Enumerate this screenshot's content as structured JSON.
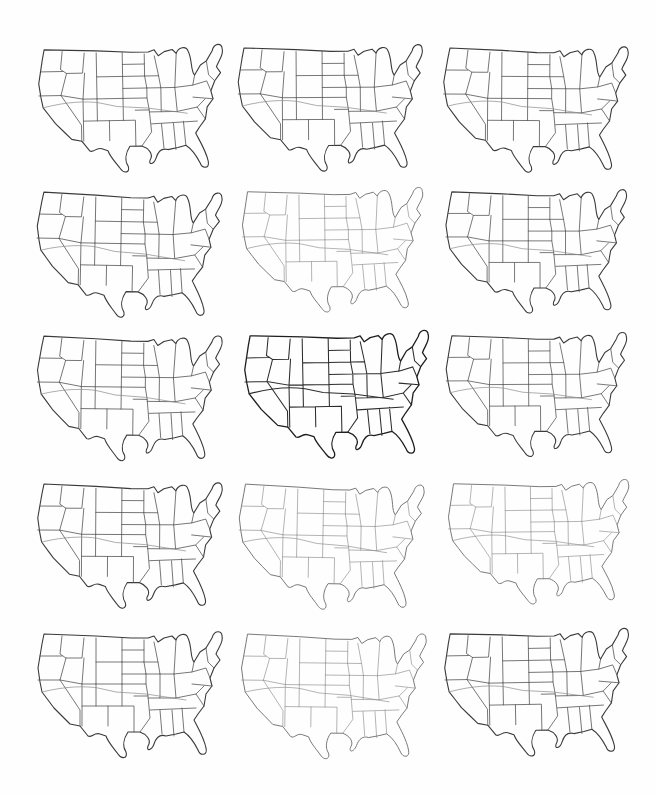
{
  "page": {
    "background": "#fefefe",
    "ink_color": "#333333"
  },
  "grid": {
    "columns": 3,
    "rows": 5,
    "maps": [
      {
        "row": 1,
        "col": 1,
        "style": "normal",
        "x": 0,
        "y": 4,
        "scale": 1.0
      },
      {
        "row": 1,
        "col": 2,
        "style": "normal",
        "x": 200,
        "y": 2,
        "scale": 1.0
      },
      {
        "row": 1,
        "col": 3,
        "style": "normal",
        "x": 406,
        "y": 2,
        "scale": 1.0
      },
      {
        "row": 2,
        "col": 1,
        "style": "normal",
        "x": 0,
        "y": 146,
        "scale": 1.0
      },
      {
        "row": 2,
        "col": 2,
        "style": "faint",
        "x": 204,
        "y": 146,
        "scale": 0.98
      },
      {
        "row": 2,
        "col": 3,
        "style": "normal",
        "x": 408,
        "y": 146,
        "scale": 0.98
      },
      {
        "row": 3,
        "col": 1,
        "style": "normal",
        "x": 0,
        "y": 290,
        "scale": 1.0
      },
      {
        "row": 3,
        "col": 2,
        "style": "dark",
        "x": 206,
        "y": 290,
        "scale": 1.0
      },
      {
        "row": 3,
        "col": 3,
        "style": "normal",
        "x": 408,
        "y": 290,
        "scale": 0.98
      },
      {
        "row": 4,
        "col": 1,
        "style": "normal",
        "x": 0,
        "y": 438,
        "scale": 1.0
      },
      {
        "row": 4,
        "col": 2,
        "style": "faint",
        "x": 202,
        "y": 438,
        "scale": 1.0
      },
      {
        "row": 4,
        "col": 3,
        "style": "faint",
        "x": 410,
        "y": 438,
        "scale": 0.98
      },
      {
        "row": 5,
        "col": 1,
        "style": "normal",
        "x": 0,
        "y": 588,
        "scale": 1.0
      },
      {
        "row": 5,
        "col": 2,
        "style": "faint",
        "x": 204,
        "y": 588,
        "scale": 1.0
      },
      {
        "row": 5,
        "col": 3,
        "style": "normal",
        "x": 406,
        "y": 588,
        "scale": 1.0
      }
    ]
  }
}
